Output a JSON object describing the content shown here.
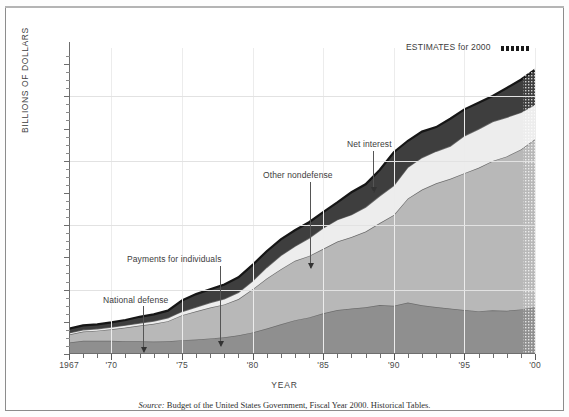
{
  "figure": {
    "y_axis_title": "BILLIONS OF DOLLARS",
    "x_axis_title": "YEAR",
    "source_prefix": "Source:",
    "source_text": "Budget of the United States Government, Fiscal Year 2000. Historical Tables.",
    "estimates_label": "ESTIMATES for 2000",
    "estimates_marker": "dotted-swatch"
  },
  "annotations": [
    {
      "key": "national-defense",
      "label": "National defense"
    },
    {
      "key": "payments-for-individuals",
      "label": "Payments for individuals"
    },
    {
      "key": "other-nondefense",
      "label": "Other nondefense"
    },
    {
      "key": "net-interest",
      "label": "Net interest"
    }
  ],
  "chart_data": {
    "type": "area",
    "stacked": true,
    "title": "",
    "subtitle": "",
    "xlabel": "YEAR",
    "ylabel": "BILLIONS OF DOLLARS",
    "xlim": [
      1967,
      2000
    ],
    "ylim": [
      0,
      1900
    ],
    "grid": "horizontal gridlines every 400; faint vertical gridlines at 5-year marks",
    "legend": "none (inline annotated labels with arrows)",
    "y_ticks_major": [
      0,
      200,
      400,
      600,
      800,
      1000,
      1200,
      1400,
      1600,
      1800
    ],
    "y_tick_labels": [
      "0",
      "200",
      "400",
      "600",
      "800",
      "1,000",
      "1,200",
      "1,400",
      "1,600",
      "1,800"
    ],
    "y_ticks_minor_step": 50,
    "gridline_values": [
      400,
      800,
      1200,
      1600
    ],
    "x": [
      1967,
      1968,
      1969,
      1970,
      1971,
      1972,
      1973,
      1974,
      1975,
      1976,
      1977,
      1978,
      1979,
      1980,
      1981,
      1982,
      1983,
      1984,
      1985,
      1986,
      1987,
      1988,
      1989,
      1990,
      1991,
      1992,
      1993,
      1994,
      1995,
      1996,
      1997,
      1998,
      1999,
      2000
    ],
    "x_tick_labels": [
      {
        "x": 1967,
        "label": "1967"
      },
      {
        "x": 1970,
        "label": "'70"
      },
      {
        "x": 1975,
        "label": "'75"
      },
      {
        "x": 1980,
        "label": "'80"
      },
      {
        "x": 1985,
        "label": "'85"
      },
      {
        "x": 1990,
        "label": "'90"
      },
      {
        "x": 1995,
        "label": "'95"
      },
      {
        "x": 2000,
        "label": "'00"
      }
    ],
    "estimate_year": 2000,
    "series": [
      {
        "name": "National defense",
        "color": "#8f8f8f",
        "order": 1,
        "values": [
          71,
          82,
          82,
          82,
          79,
          79,
          77,
          79,
          86,
          90,
          97,
          104,
          116,
          134,
          158,
          185,
          210,
          227,
          253,
          273,
          282,
          290,
          304,
          300,
          320,
          303,
          292,
          282,
          273,
          266,
          271,
          269,
          277,
          291
        ]
      },
      {
        "name": "Payments for individuals",
        "color": "#b8b8b8",
        "order": 2,
        "values": [
          50,
          57,
          63,
          72,
          85,
          98,
          111,
          125,
          155,
          175,
          192,
          204,
          225,
          268,
          311,
          342,
          369,
          382,
          400,
          425,
          444,
          470,
          509,
          563,
          646,
          718,
          768,
          806,
          850,
          890,
          928,
          958,
          993,
          1043
        ]
      },
      {
        "name": "Net interest",
        "color": "#ededed",
        "order": 3,
        "values": [
          10,
          11,
          12,
          14,
          15,
          15,
          17,
          21,
          23,
          27,
          30,
          35,
          42,
          52,
          69,
          85,
          90,
          111,
          130,
          136,
          139,
          152,
          169,
          184,
          194,
          199,
          199,
          203,
          232,
          241,
          244,
          243,
          230,
          215
        ]
      },
      {
        "name": "Other nondefense",
        "color": "#3e3e3e",
        "order": 4,
        "values": [
          26,
          28,
          27,
          28,
          32,
          39,
          41,
          44,
          68,
          80,
          83,
          89,
          93,
          99,
          100,
          100,
          99,
          98,
          98,
          107,
          139,
          142,
          161,
          206,
          164,
          161,
          150,
          170,
          164,
          163,
          159,
          182,
          203,
          217
        ]
      }
    ],
    "totals": [
      157,
      178,
      184,
      196,
      211,
      231,
      246,
      269,
      332,
      372,
      402,
      432,
      476,
      553,
      638,
      712,
      768,
      818,
      881,
      941,
      1004,
      1054,
      1143,
      1253,
      1324,
      1381,
      1409,
      1461,
      1519,
      1560,
      1602,
      1652,
      1703,
      1766
    ]
  }
}
